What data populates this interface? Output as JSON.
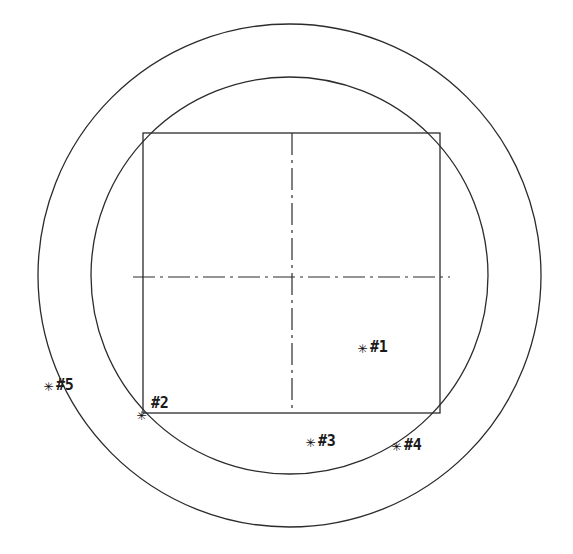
{
  "drawing": {
    "title": "Concentric Circle and Inscribed Square Technical Drawing",
    "background_color": "#ffffff",
    "line_color": "#2b2b2b",
    "text_color": "#1a1a1a",
    "canvas": {
      "width": 573,
      "height": 554
    },
    "center": {
      "x": 289.5,
      "y": 275.5
    },
    "outer_circle": {
      "cx": 289.5,
      "cy": 275.5,
      "r": 251.5
    },
    "inner_circle": {
      "cx": 289.5,
      "cy": 275.5,
      "r": 198.5
    },
    "square": {
      "x": 143,
      "y": 133,
      "width": 297,
      "height": 280
    },
    "centerline_horizontal": {
      "x1": 133,
      "y1": 277,
      "x2": 450,
      "y2": 277
    },
    "centerline_vertical": {
      "x1": 292,
      "y1": 133,
      "x2": 292,
      "y2": 413
    },
    "marker_glyph": "✳"
  },
  "points": [
    {
      "id": "p1",
      "label": "#1",
      "marker": "✳",
      "marker_x": 358,
      "marker_y": 340,
      "label_x": 370,
      "label_y": 340,
      "location": "inside-square-lower-right"
    },
    {
      "id": "p2",
      "label": "#2",
      "marker": "✳",
      "marker_x": 137,
      "marker_y": 407,
      "label_x": 151,
      "label_y": 396,
      "location": "square-bottom-left-corner-on-inner-circle"
    },
    {
      "id": "p3",
      "label": "#3",
      "marker": "✳",
      "marker_x": 306,
      "marker_y": 434,
      "label_x": 318,
      "label_y": 434,
      "location": "below-square-bottom-edge"
    },
    {
      "id": "p4",
      "label": "#4",
      "marker": "✳",
      "marker_x": 392,
      "marker_y": 438,
      "label_x": 404,
      "label_y": 438,
      "location": "on-inner-circle-lower-right"
    },
    {
      "id": "p5",
      "label": "#5",
      "marker": "✳",
      "marker_x": 44,
      "marker_y": 378,
      "label_x": 56,
      "label_y": 378,
      "location": "in-annulus-ring-left"
    }
  ]
}
